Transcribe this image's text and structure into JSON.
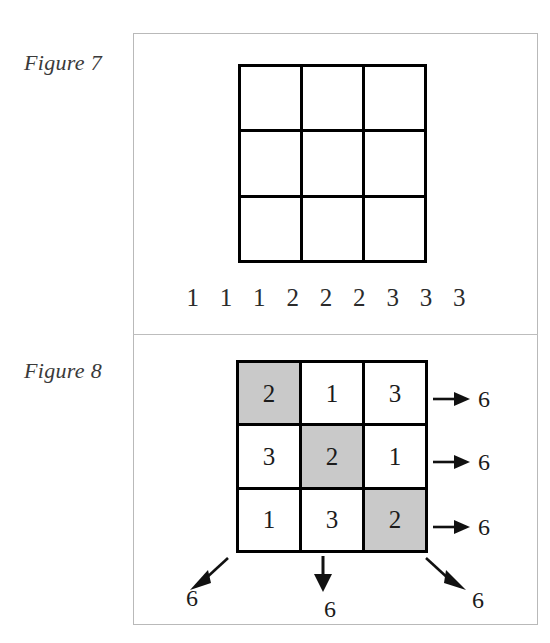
{
  "page": {
    "background_color": "#ffffff",
    "frame_border_color": "#b9b9b9"
  },
  "figure7": {
    "caption": "Figure 7",
    "grid": {
      "rows": 3,
      "cols": 3,
      "cells": [
        [
          {
            "value": "",
            "shaded": false
          },
          {
            "value": "",
            "shaded": false
          },
          {
            "value": "",
            "shaded": false
          }
        ],
        [
          {
            "value": "",
            "shaded": false
          },
          {
            "value": "",
            "shaded": false
          },
          {
            "value": "",
            "shaded": false
          }
        ],
        [
          {
            "value": "",
            "shaded": false
          },
          {
            "value": "",
            "shaded": false
          },
          {
            "value": "",
            "shaded": false
          }
        ]
      ]
    },
    "number_strip": [
      "1",
      "1",
      "1",
      "2",
      "2",
      "2",
      "3",
      "3",
      "3"
    ]
  },
  "figure8": {
    "caption": "Figure 8",
    "shade_color": "#c9c9c9",
    "grid": {
      "rows": 3,
      "cols": 3,
      "cells": [
        [
          {
            "value": "2",
            "shaded": true
          },
          {
            "value": "1",
            "shaded": false
          },
          {
            "value": "3",
            "shaded": false
          }
        ],
        [
          {
            "value": "3",
            "shaded": false
          },
          {
            "value": "2",
            "shaded": true
          },
          {
            "value": "1",
            "shaded": false
          }
        ],
        [
          {
            "value": "1",
            "shaded": false
          },
          {
            "value": "3",
            "shaded": false
          },
          {
            "value": "2",
            "shaded": true
          }
        ]
      ]
    },
    "row_sums": [
      "6",
      "6",
      "6"
    ],
    "column_sum": "6",
    "diagonal_sums": {
      "anti_diagonal": "6",
      "main_diagonal": "6"
    },
    "arrow_icons": {
      "row": "arrow-right-icon",
      "column": "arrow-down-icon",
      "anti_diagonal": "arrow-down-left-icon",
      "main_diagonal": "arrow-down-right-icon"
    }
  }
}
